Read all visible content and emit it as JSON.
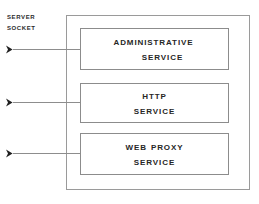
{
  "diagram": {
    "background_color": "#ffffff",
    "outer_box": {
      "name": "service-container",
      "border_color": "#9a9a9a"
    },
    "entry_label": {
      "line1": "Server",
      "line2": "Socket",
      "color": "#2b2b2b"
    },
    "connectors": [
      {
        "name": "connector-administrative",
        "arrow": "arrowhead-right"
      },
      {
        "name": "connector-http",
        "arrow": "arrowhead-right"
      },
      {
        "name": "connector-web-proxy",
        "arrow": "arrowhead-right"
      }
    ],
    "services": [
      {
        "id": "administrative-service",
        "line1": "Administrative",
        "line2": "Service",
        "border_color": "#8c8c8c",
        "text_color": "#262626"
      },
      {
        "id": "http-service",
        "line1": "HTTP",
        "line2": "Service",
        "border_color": "#8c8c8c",
        "text_color": "#262626"
      },
      {
        "id": "web-proxy-service",
        "line1": "Web Proxy",
        "line2": "Service",
        "border_color": "#8c8c8c",
        "text_color": "#262626"
      }
    ]
  }
}
